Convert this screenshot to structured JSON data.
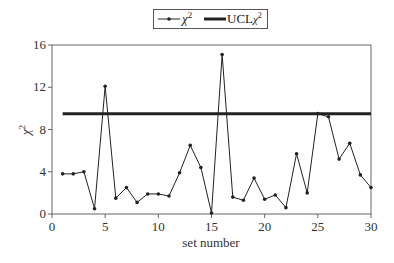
{
  "chart_data": {
    "type": "line",
    "title": "",
    "xlabel": "set number",
    "ylabel": "χ²",
    "xlim": [
      0,
      30
    ],
    "ylim": [
      0,
      16
    ],
    "xticks": [
      0,
      5,
      10,
      15,
      20,
      25,
      30
    ],
    "yticks": [
      0,
      4,
      8,
      12,
      16
    ],
    "grid": false,
    "legend_position": "top-center",
    "x": [
      1,
      2,
      3,
      4,
      5,
      6,
      7,
      8,
      9,
      10,
      11,
      12,
      13,
      14,
      15,
      16,
      17,
      18,
      19,
      20,
      21,
      22,
      23,
      24,
      25,
      26,
      27,
      28,
      29,
      30
    ],
    "series": [
      {
        "name": "χ²",
        "style": "line-with-markers",
        "color": "#222222",
        "values": [
          3.8,
          3.8,
          4.0,
          0.5,
          12.1,
          1.5,
          2.5,
          1.1,
          1.9,
          1.9,
          1.7,
          3.9,
          6.5,
          4.4,
          0.1,
          15.1,
          1.6,
          1.3,
          3.4,
          1.4,
          1.8,
          0.6,
          5.7,
          2.0,
          9.5,
          9.2,
          5.2,
          6.7,
          3.7,
          2.5
        ]
      },
      {
        "name": "UCLχ²",
        "style": "thick-line",
        "color": "#222222",
        "values": [
          9.5,
          9.5,
          9.5,
          9.5,
          9.5,
          9.5,
          9.5,
          9.5,
          9.5,
          9.5,
          9.5,
          9.5,
          9.5,
          9.5,
          9.5,
          9.5,
          9.5,
          9.5,
          9.5,
          9.5,
          9.5,
          9.5,
          9.5,
          9.5,
          9.5,
          9.5,
          9.5,
          9.5,
          9.5,
          9.5
        ]
      }
    ]
  },
  "legend": {
    "items": [
      {
        "label_main": "χ",
        "label_sup": "2"
      },
      {
        "label_main": "UCL",
        "label_sym": "χ",
        "label_sup": "2"
      }
    ]
  },
  "axes": {
    "x_title": "set number",
    "y_title_main": "χ",
    "y_title_sup": "2"
  }
}
